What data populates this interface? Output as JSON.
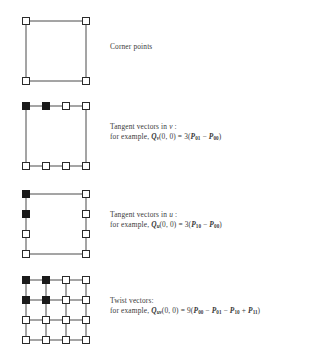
{
  "figure": {
    "background": "#ffffff",
    "line_color": "#4a4a4a",
    "node_open_fill": "#ffffff",
    "node_filled_fill": "#1a1a1a",
    "node_stroke": "#2b2b2b",
    "text_color": "#3a3a3a"
  },
  "rows": [
    {
      "id": "corner-points",
      "title": "Corner points",
      "example_prefix": "",
      "formula": "",
      "diagram": {
        "type": "control-point-grid",
        "cols": 4,
        "rows": 4,
        "visible_nodes": [
          [
            0,
            0
          ],
          [
            0,
            3
          ],
          [
            3,
            0
          ],
          [
            3,
            3
          ]
        ],
        "filled_nodes": [],
        "edges": "outer-square"
      }
    },
    {
      "id": "tangent-vectors-v",
      "title": "Tangent vectors in v :",
      "title_plain": "Tangent vectors in",
      "title_italic": "v",
      "title_suffix": ":",
      "example_prefix": "for example,",
      "formula_Q": "Q",
      "formula_Q_sub": "v",
      "formula_args": "(0, 0) = 3(",
      "formula_terms": [
        {
          "sym": "P",
          "sub": "01",
          "op": ""
        },
        {
          "sym": "P",
          "sub": "00",
          "op": "−"
        }
      ],
      "formula_close": ")",
      "diagram": {
        "type": "control-point-grid",
        "cols": 4,
        "rows": 4,
        "visible_nodes": [
          [
            0,
            0
          ],
          [
            0,
            1
          ],
          [
            0,
            2
          ],
          [
            0,
            3
          ],
          [
            3,
            0
          ],
          [
            3,
            1
          ],
          [
            3,
            2
          ],
          [
            3,
            3
          ]
        ],
        "filled_nodes": [
          [
            0,
            0
          ],
          [
            0,
            1
          ]
        ],
        "edges": "outer-square-plus-top-bottom-rows"
      }
    },
    {
      "id": "tangent-vectors-u",
      "title": "Tangent vectors in u :",
      "title_plain": "Tangent vectors in",
      "title_italic": "u",
      "title_suffix": ":",
      "example_prefix": "for example,",
      "formula_Q": "Q",
      "formula_Q_sub": "u",
      "formula_args": "(0, 0) = 3(",
      "formula_terms": [
        {
          "sym": "P",
          "sub": "10",
          "op": ""
        },
        {
          "sym": "P",
          "sub": "00",
          "op": "−"
        }
      ],
      "formula_close": ")",
      "diagram": {
        "type": "control-point-grid",
        "cols": 4,
        "rows": 4,
        "visible_nodes": [
          [
            0,
            0
          ],
          [
            1,
            0
          ],
          [
            2,
            0
          ],
          [
            3,
            0
          ],
          [
            0,
            3
          ],
          [
            1,
            3
          ],
          [
            2,
            3
          ],
          [
            3,
            3
          ]
        ],
        "filled_nodes": [
          [
            0,
            0
          ],
          [
            1,
            0
          ]
        ],
        "edges": "outer-square-plus-left-right-cols"
      }
    },
    {
      "id": "twist-vectors",
      "title": "Twist vectors:",
      "title_plain": "Twist vectors:",
      "title_italic": "",
      "title_suffix": "",
      "example_prefix": "for example,",
      "formula_Q": "Q",
      "formula_Q_sub": "uv",
      "formula_args": "(0, 0) = 9(",
      "formula_terms": [
        {
          "sym": "P",
          "sub": "00",
          "op": ""
        },
        {
          "sym": "P",
          "sub": "01",
          "op": "−"
        },
        {
          "sym": "P",
          "sub": "10",
          "op": "−"
        },
        {
          "sym": "P",
          "sub": "11",
          "op": "+"
        }
      ],
      "formula_close": ")",
      "diagram": {
        "type": "control-point-grid",
        "cols": 4,
        "rows": 4,
        "visible_nodes": "all-16",
        "filled_nodes": [
          [
            0,
            0
          ],
          [
            0,
            1
          ],
          [
            1,
            0
          ],
          [
            1,
            1
          ]
        ],
        "edges": "full-grid"
      }
    }
  ]
}
